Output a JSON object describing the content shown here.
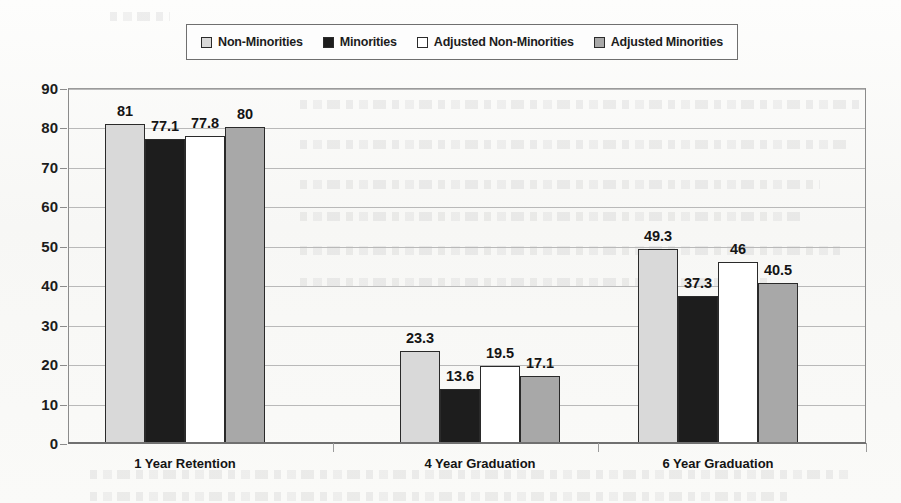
{
  "chart_data": {
    "type": "bar",
    "title": "",
    "xlabel": "",
    "ylabel": "",
    "ylim": [
      0,
      90
    ],
    "ytick_step": 10,
    "yticks": [
      0,
      10,
      20,
      30,
      40,
      50,
      60,
      70,
      80,
      90
    ],
    "grid": true,
    "legend_position": "top",
    "categories": [
      "1 Year Retention",
      "4 Year Graduation",
      "6 Year Graduation"
    ],
    "series": [
      {
        "name": "Non-Minorities",
        "color": "#d9d9d9",
        "values": [
          81,
          23.3,
          49.3
        ],
        "labels": [
          "81",
          "23.3",
          "49.3"
        ]
      },
      {
        "name": "Minorities",
        "color": "#1d1d1d",
        "values": [
          77.1,
          13.6,
          37.3
        ],
        "labels": [
          "77.1",
          "13.6",
          "37.3"
        ]
      },
      {
        "name": "Adjusted Non-Minorities",
        "color": "#ffffff",
        "values": [
          77.8,
          19.5,
          46
        ],
        "labels": [
          "77.8",
          "19.5",
          "46"
        ]
      },
      {
        "name": "Adjusted Minorities",
        "color": "#a8a8a8",
        "values": [
          80,
          17.1,
          40.5
        ],
        "labels": [
          "80",
          "17.1",
          "40.5"
        ]
      }
    ]
  },
  "legend": {
    "items": [
      {
        "label": "Non-Minorities",
        "color": "#d9d9d9"
      },
      {
        "label": "Minorities",
        "color": "#1d1d1d"
      },
      {
        "label": "Adjusted Non-Minorities",
        "color": "#ffffff"
      },
      {
        "label": "Adjusted Minorities",
        "color": "#a8a8a8"
      }
    ]
  },
  "colors": {
    "axis": "#8b8b8b",
    "grid": "#b9b9b9",
    "text": "#141414",
    "paper": "#fbfbfa",
    "bar_outline": "#2a2a2a"
  }
}
